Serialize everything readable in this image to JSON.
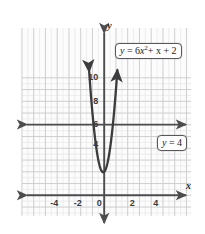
{
  "figure": {
    "kind": "coordinate-grid-graph",
    "background_color": "#ffffff",
    "grid": {
      "minor_color": "#e4e4e4",
      "major_color": "#c9c9c9",
      "axis_color": "#4d4d4f",
      "curve_color": "#3c3c3e",
      "minor_step_px": 5.8,
      "major_every": 2,
      "plot_left_px": 22,
      "plot_top_px": 28,
      "plot_right_px": 191,
      "plot_bottom_px": 216
    },
    "axes": {
      "x_label": "x",
      "y_label": "y",
      "origin_label": "0",
      "x_ticks": [
        "-4",
        "-2",
        "0",
        "2",
        "4"
      ],
      "x_tick_values": [
        -4,
        -2,
        0,
        2,
        4
      ],
      "y_ticks": [
        "4",
        "6",
        "8",
        "10"
      ],
      "y_tick_values": [
        4,
        6,
        8,
        10
      ],
      "xlim": [
        -5.3,
        5.3
      ],
      "ylim": [
        -2.6,
        10.9
      ]
    },
    "callouts": [
      {
        "id": "curve-equation",
        "text": "y = 6x² + x + 2",
        "lhs": "y",
        "eq": " = 6",
        "base": "x",
        "exp": "2",
        "tail": "+ x + 2"
      },
      {
        "id": "line-equation",
        "text": "y = 4",
        "lhs": "y",
        "tail": " = 4"
      }
    ]
  },
  "chart_data": {
    "type": "line",
    "title": "",
    "xlabel": "x",
    "ylabel": "y",
    "xlim": [
      -5.3,
      5.3
    ],
    "ylim": [
      -2.6,
      10.9
    ],
    "grid": true,
    "legend": "annotations",
    "x_ticks": [
      -4,
      -2,
      0,
      2,
      4
    ],
    "y_ticks": [
      4,
      6,
      8,
      10
    ],
    "series": [
      {
        "name": "y = 6x² + x + 2",
        "type": "parabola",
        "equation": "y = 6x^2 + x + 2",
        "a": 6,
        "b": 1,
        "c": 2,
        "vertex": [
          -0.083,
          1.958
        ],
        "color": "#3c3c3e",
        "arrows": "both",
        "x_range": [
          -1.28,
          1.12
        ],
        "points": [
          [
            -1.25,
            10.13
          ],
          [
            -1.1,
            8.16
          ],
          [
            -1.0,
            7.0
          ],
          [
            -0.9,
            5.96
          ],
          [
            -0.8,
            5.04
          ],
          [
            -0.7,
            4.24
          ],
          [
            -0.6,
            3.56
          ],
          [
            -0.5,
            3.0
          ],
          [
            -0.4,
            2.56
          ],
          [
            -0.3,
            2.24
          ],
          [
            -0.2,
            2.04
          ],
          [
            -0.083,
            1.958
          ],
          [
            0.0,
            2.0
          ],
          [
            0.1,
            2.16
          ],
          [
            0.2,
            2.44
          ],
          [
            0.3,
            2.84
          ],
          [
            0.4,
            3.36
          ],
          [
            0.5,
            4.0
          ],
          [
            0.6,
            4.76
          ],
          [
            0.7,
            5.64
          ],
          [
            0.8,
            6.64
          ],
          [
            0.9,
            7.76
          ],
          [
            1.0,
            9.0
          ],
          [
            1.1,
            10.36
          ]
        ]
      },
      {
        "name": "y = 4",
        "type": "horizontal-line",
        "equation": "y = 4",
        "y_value": 4,
        "color": "#4d4d4f",
        "arrows": "both",
        "x_range": [
          -5.3,
          5.3
        ]
      }
    ],
    "intersections": [
      [
        -0.7,
        4
      ],
      [
        0.5,
        4
      ]
    ],
    "annotations": [
      {
        "text": "y = 6x² + x + 2",
        "x": 1.6,
        "y": 9.1
      },
      {
        "text": "y = 4",
        "x": 3.5,
        "y": 3.1
      }
    ]
  }
}
